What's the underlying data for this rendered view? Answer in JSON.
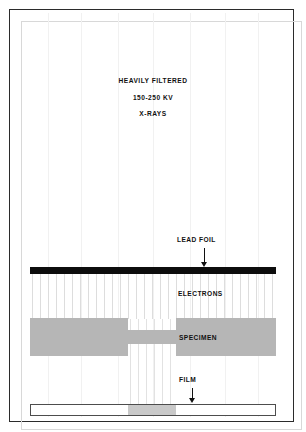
{
  "figure": {
    "kind": "radiography-schematic-diagram",
    "background_color": "#ffffff",
    "frame_color": "#2b2b2b"
  },
  "beam": {
    "title_lines": [
      "HEAVILY FILTERED",
      "150-250 KV",
      "X-RAYS"
    ],
    "guide_line_color": "#f1f1f1",
    "guide_line_positions": [
      48,
      81,
      118,
      153,
      190,
      225,
      258
    ]
  },
  "labels": {
    "lead_foil": "LEAD FOIL",
    "electrons": "ELECTRONS",
    "specimen": "SPECIMEN",
    "film": "FILM"
  },
  "layers": {
    "lead_foil": {
      "label": "LEAD FOIL",
      "color": "#0d0d0d",
      "has_arrow": true
    },
    "electrons": {
      "label": "ELECTRONS",
      "streak_color": "#dddddd",
      "has_arrow": false
    },
    "specimen": {
      "label": "SPECIMEN",
      "color": "#b6b6b6",
      "has_arrow": false,
      "profile": "thick-thin-thick"
    },
    "film": {
      "label": "FILM",
      "base_color": "#ffffff",
      "exposed_color": "#c9c9c9",
      "outline_color": "#4d4d4d",
      "has_arrow": true
    }
  }
}
